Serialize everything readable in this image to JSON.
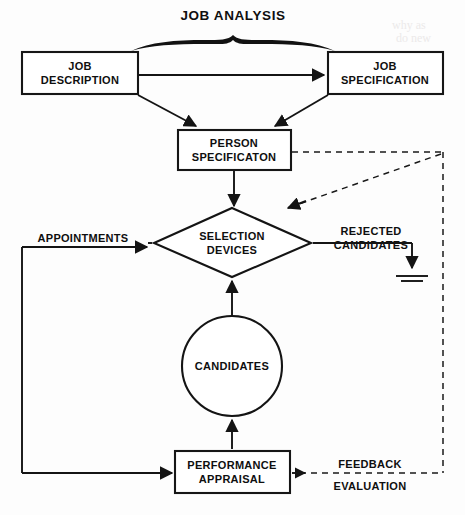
{
  "diagram": {
    "title": "JOB ANALYSIS",
    "nodes": {
      "job_description": {
        "line1": "JOB",
        "line2": "DESCRIPTION"
      },
      "job_specification": {
        "line1": "JOB",
        "line2": "SPECIFICATION"
      },
      "person_specification": {
        "line1": "PERSON",
        "line2": "SPECIFICATON"
      },
      "selection_devices": {
        "line1": "SELECTION",
        "line2": "DEVICES"
      },
      "candidates": {
        "line1": "CANDIDATES"
      },
      "performance_appraisal": {
        "line1": "PERFORMANCE",
        "line2": "APPRAISAL"
      }
    },
    "labels": {
      "appointments": "APPOINTMENTS",
      "rejected_candidates_line1": "REJECTED",
      "rejected_candidates_line2": "CANDIDATES",
      "feedback": "FEEDBACK",
      "evaluation": "EVALUATION"
    },
    "colors": {
      "ink": "#141414",
      "paper": "#fdfdfd",
      "shape_fill": "#ffffff"
    }
  }
}
